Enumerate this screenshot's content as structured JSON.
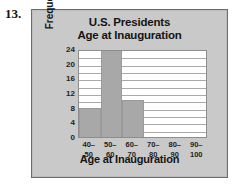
{
  "problem": {
    "number": "13."
  },
  "chart_data": {
    "type": "bar",
    "title": "U.S. Presidents",
    "subtitle": "Age at Inauguration",
    "xlabel": "Age at Inauguration",
    "ylabel": "Frequency",
    "categories": [
      "40–\n50",
      "50–\n60",
      "60–\n70",
      "70–\n80",
      "80–\n90",
      "90–\n100"
    ],
    "category_parts": [
      {
        "lo": "40–",
        "hi": "50"
      },
      {
        "lo": "50–",
        "hi": "60"
      },
      {
        "lo": "60–",
        "hi": "70"
      },
      {
        "lo": "70–",
        "hi": "80"
      },
      {
        "lo": "80–",
        "hi": "90"
      },
      {
        "lo": "90–",
        "hi": "100"
      }
    ],
    "values": [
      8,
      24,
      10,
      0,
      0,
      0
    ],
    "ylim": [
      0,
      24
    ],
    "yticks": [
      24,
      20,
      16,
      12,
      8,
      4,
      0
    ],
    "gridline_step": 2,
    "grid": true,
    "legend": false,
    "bar_color": "#a8a8a8",
    "plot_background": "#ffffff",
    "frame_background": "#c9c9c9"
  }
}
